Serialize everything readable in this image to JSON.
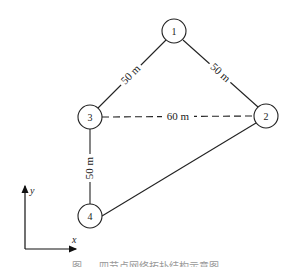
{
  "diagram": {
    "nodes": [
      {
        "id": "1",
        "label": "1",
        "x": 174,
        "y": 31
      },
      {
        "id": "2",
        "label": "2",
        "x": 266,
        "y": 116
      },
      {
        "id": "3",
        "label": "3",
        "x": 90,
        "y": 117
      },
      {
        "id": "4",
        "label": "4",
        "x": 90,
        "y": 216
      }
    ],
    "edges": [
      {
        "from": "1",
        "to": "3",
        "label": "50 m",
        "style": "solid"
      },
      {
        "from": "1",
        "to": "2",
        "label": "50 m",
        "style": "solid"
      },
      {
        "from": "3",
        "to": "2",
        "label": "60 m",
        "style": "dashed"
      },
      {
        "from": "3",
        "to": "4",
        "label": "50 m",
        "style": "solid"
      },
      {
        "from": "4",
        "to": "2",
        "label": "",
        "style": "solid"
      }
    ],
    "axes": {
      "x_label": "x",
      "y_label": "y"
    },
    "caption": "图 — 四节点网络拓扑结构示意图"
  }
}
